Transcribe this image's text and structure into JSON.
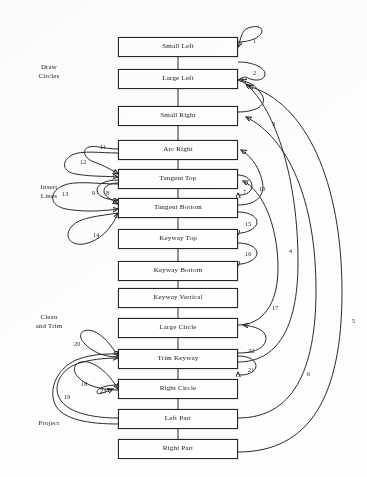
{
  "figure": {
    "background_color": "#fdfdfc",
    "ink_color": "#262524"
  },
  "groups": [
    {
      "id": "draw-circles",
      "line1": "Draw",
      "line2": "Circles",
      "x": 22,
      "y": 63,
      "w": 54
    },
    {
      "id": "insert-lines",
      "line1": "Insert",
      "line2": "Lines",
      "x": 22,
      "y": 183,
      "w": 54
    },
    {
      "id": "clean-and-trim",
      "line1": "Clean",
      "line2": "and Trim",
      "x": 20,
      "y": 313,
      "w": 58
    },
    {
      "id": "project",
      "line1": "Project",
      "line2": "",
      "x": 22,
      "y": 419,
      "w": 54
    }
  ],
  "nodes": [
    {
      "id": "small-left",
      "label": "Small Left",
      "x": 118,
      "y": 37,
      "w": 120,
      "h": 20
    },
    {
      "id": "large-left",
      "label": "Large Left",
      "x": 118,
      "y": 69,
      "w": 120,
      "h": 20
    },
    {
      "id": "small-right",
      "label": "Small Right",
      "x": 118,
      "y": 106,
      "w": 120,
      "h": 20
    },
    {
      "id": "arc-right",
      "label": "Arc Right",
      "x": 118,
      "y": 140,
      "w": 120,
      "h": 20
    },
    {
      "id": "tangent-top",
      "label": "Tangent Top",
      "x": 118,
      "y": 169,
      "w": 120,
      "h": 20
    },
    {
      "id": "tangent-bottom",
      "label": "Tangent Bottom",
      "x": 118,
      "y": 198,
      "w": 120,
      "h": 20
    },
    {
      "id": "keyway-top",
      "label": "Keyway Top",
      "x": 118,
      "y": 229,
      "w": 120,
      "h": 20
    },
    {
      "id": "keyway-bottom",
      "label": "Keyway Bottom",
      "x": 118,
      "y": 261,
      "w": 120,
      "h": 20
    },
    {
      "id": "keyway-vertical",
      "label": "Keyway Vertical",
      "x": 118,
      "y": 288,
      "w": 120,
      "h": 20
    },
    {
      "id": "large-circle",
      "label": "Large Circle",
      "x": 118,
      "y": 318,
      "w": 120,
      "h": 20
    },
    {
      "id": "trim-keyway",
      "label": "Trim Keyway",
      "x": 118,
      "y": 349,
      "w": 120,
      "h": 20
    },
    {
      "id": "right-circle",
      "label": "Right Circle",
      "x": 118,
      "y": 379,
      "w": 120,
      "h": 20
    },
    {
      "id": "left-part",
      "label": "Left Part",
      "x": 118,
      "y": 409,
      "w": 120,
      "h": 20
    },
    {
      "id": "right-part",
      "label": "Right Part",
      "x": 118,
      "y": 439,
      "w": 120,
      "h": 20
    }
  ],
  "edge_labels": [
    {
      "id": "e1",
      "text": "1",
      "x": 253,
      "y": 38
    },
    {
      "id": "e2",
      "text": "2",
      "x": 253,
      "y": 70
    },
    {
      "id": "e3",
      "text": "3",
      "x": 272,
      "y": 121
    },
    {
      "id": "e4",
      "text": "4",
      "x": 289,
      "y": 248
    },
    {
      "id": "e5",
      "text": "5",
      "x": 352,
      "y": 318
    },
    {
      "id": "e6",
      "text": "6",
      "x": 307,
      "y": 371
    },
    {
      "id": "e7",
      "text": "7",
      "x": 243,
      "y": 189
    },
    {
      "id": "e8",
      "text": "8",
      "x": 106,
      "y": 190
    },
    {
      "id": "e9",
      "text": "9",
      "x": 92,
      "y": 190
    },
    {
      "id": "e10",
      "text": "10",
      "x": 259,
      "y": 186
    },
    {
      "id": "e11",
      "text": "11",
      "x": 100,
      "y": 144
    },
    {
      "id": "e12",
      "text": "12",
      "x": 80,
      "y": 159
    },
    {
      "id": "e13",
      "text": "13",
      "x": 62,
      "y": 191
    },
    {
      "id": "e14",
      "text": "14",
      "x": 93,
      "y": 232
    },
    {
      "id": "e15",
      "text": "15",
      "x": 245,
      "y": 221
    },
    {
      "id": "e16",
      "text": "16",
      "x": 245,
      "y": 251
    },
    {
      "id": "e17",
      "text": "17",
      "x": 272,
      "y": 305
    },
    {
      "id": "e18",
      "text": "18",
      "x": 81,
      "y": 381
    },
    {
      "id": "e19",
      "text": "19",
      "x": 64,
      "y": 394
    },
    {
      "id": "e20",
      "text": "20",
      "x": 74,
      "y": 341
    },
    {
      "id": "e21",
      "text": "21",
      "x": 248,
      "y": 367
    },
    {
      "id": "e22",
      "text": "22",
      "x": 248,
      "y": 348
    },
    {
      "id": "e23",
      "text": "23",
      "x": 100,
      "y": 388
    }
  ],
  "edges": {
    "sequence_chain": [
      "small-left->large-left",
      "large-left->small-right",
      "small-right->arc-right",
      "arc-right->tangent-top",
      "tangent-top->tangent-bottom",
      "tangent-bottom->keyway-top",
      "keyway-top->keyway-bottom",
      "keyway-bottom->keyway-vertical",
      "keyway-vertical->large-circle",
      "large-circle->trim-keyway",
      "trim-keyway->right-circle",
      "right-circle->left-part",
      "left-part->right-part"
    ],
    "self_loops": [
      {
        "label": "1",
        "node": "small-left",
        "side": "right"
      },
      {
        "label": "2",
        "node": "large-left",
        "side": "right"
      },
      {
        "label": "7",
        "node": "tangent-top",
        "side": "right"
      },
      {
        "label": "15",
        "node": "keyway-top",
        "side": "right"
      },
      {
        "label": "16",
        "node": "keyway-bottom",
        "side": "right"
      },
      {
        "label": "9",
        "node": "tangent-top",
        "side": "left"
      },
      {
        "label": "8",
        "node": "tangent-bottom",
        "side": "left"
      },
      {
        "label": "21",
        "node": "trim-keyway",
        "side": "right"
      },
      {
        "label": "23",
        "node": "right-circle",
        "side": "left"
      }
    ],
    "feedback": [
      {
        "label": "3",
        "from": "small-right",
        "to": "large-left"
      },
      {
        "label": "4",
        "from": "trim-keyway",
        "to": "large-left"
      },
      {
        "label": "5",
        "from": "right-part",
        "to": "large-left"
      },
      {
        "label": "6",
        "from": "left-part",
        "to": "small-right"
      },
      {
        "label": "10",
        "from": "tangent-bottom",
        "to": "arc-right"
      },
      {
        "label": "17",
        "from": "large-circle",
        "to": "tangent-top"
      },
      {
        "label": "22",
        "from": "trim-keyway",
        "to": "large-circle"
      },
      {
        "label": "11",
        "from": "tangent-top",
        "to": "arc-right"
      },
      {
        "label": "12",
        "from": "tangent-top",
        "to": "arc-right"
      },
      {
        "label": "13",
        "from": "tangent-bottom",
        "to": "tangent-top"
      },
      {
        "label": "14",
        "from": "keyway-top",
        "to": "tangent-bottom"
      },
      {
        "label": "18",
        "from": "left-part",
        "to": "trim-keyway"
      },
      {
        "label": "19",
        "from": "left-part",
        "to": "trim-keyway"
      },
      {
        "label": "20",
        "from": "large-circle",
        "to": "trim-keyway"
      }
    ]
  }
}
